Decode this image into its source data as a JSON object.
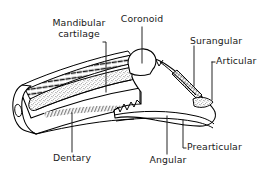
{
  "figure": {
    "background_color": "#ffffff",
    "line_color": "#000000",
    "text_color": "#1a1a1a"
  },
  "labels": {
    "mandibular_cartilage": "Mandibular\ncartilage",
    "mandibular_cartilage_line1": "Mandibular",
    "mandibular_cartilage_line2": "cartilage",
    "coronoid": "Coronoid",
    "surangular": "Surangular",
    "articular": "Articular",
    "prearticular": "Prearticular",
    "angular": "Angular",
    "dentary": "Dentary"
  },
  "parts": [
    {
      "id": "mandibular-cartilage",
      "label": "Mandibular cartilage",
      "leader": "vertical-with-corner-bracket",
      "texture": "stipple"
    },
    {
      "id": "coronoid",
      "label": "Coronoid",
      "leader": "vertical",
      "texture": "plain"
    },
    {
      "id": "surangular",
      "label": "Surangular",
      "leader": "vertical",
      "texture": "cross-hatch"
    },
    {
      "id": "articular",
      "label": "Articular",
      "leader": "corner-bracket-left",
      "texture": "stipple"
    },
    {
      "id": "prearticular",
      "label": "Prearticular",
      "leader": "corner-bracket-up-left",
      "texture": "plain"
    },
    {
      "id": "angular",
      "label": "Angular",
      "leader": "vertical",
      "texture": "plain"
    },
    {
      "id": "dentary",
      "label": "Dentary",
      "leader": "vertical",
      "texture": "plain-with-hatch-edge"
    }
  ]
}
